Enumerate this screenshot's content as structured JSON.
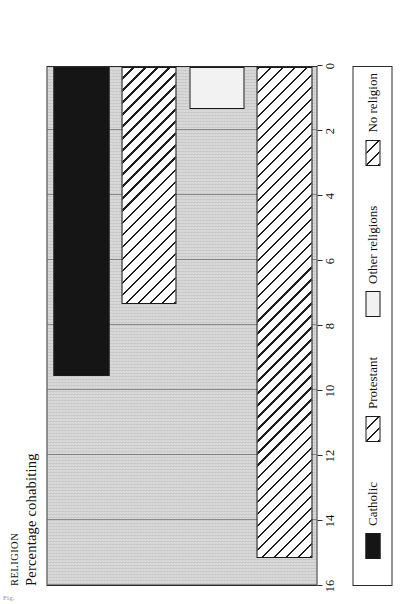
{
  "page": {
    "caption_fragment": "Fig."
  },
  "heading": {
    "kicker": "RELIGION",
    "subtitle": "Percentage  cohabiting"
  },
  "legend": {
    "items": [
      {
        "label": "Catholic",
        "swatch": "solid-black-swatch"
      },
      {
        "label": "Protestant",
        "swatch": "diagonal-hatch-swatch"
      },
      {
        "label": "Other  religions",
        "swatch": "light-fill-swatch"
      },
      {
        "label": "No  religion",
        "swatch": "diagonal-hatch-swatch"
      }
    ]
  },
  "chart_data": {
    "type": "bar",
    "title": "RELIGION",
    "subtitle": "Percentage  cohabiting",
    "orientation": "vertical-bars-printed-sideways",
    "xlabel": "",
    "ylabel": "Percentage cohabiting",
    "categories": [
      "Catholic",
      "Protestant",
      "Other religions",
      "No religion"
    ],
    "values": [
      9.5,
      7.3,
      1.3,
      15.1
    ],
    "ylim": [
      0,
      16
    ],
    "ticks": [
      16,
      14,
      12,
      10,
      8,
      6,
      4,
      2,
      0
    ],
    "tick_labels": [
      "16",
      "14",
      "12",
      "10",
      "8",
      "6",
      "4",
      "2",
      "0"
    ],
    "grid": true,
    "legend_position": "below-plot",
    "series": [
      {
        "name": "Percentage cohabiting",
        "points": [
          {
            "category": "Catholic",
            "value": 9.5,
            "fill": "solid-black"
          },
          {
            "category": "Protestant",
            "value": 7.3,
            "fill": "diagonal-hatch"
          },
          {
            "category": "Other religions",
            "value": 1.3,
            "fill": "light-fill"
          },
          {
            "category": "No religion",
            "value": 15.1,
            "fill": "diagonal-hatch"
          }
        ]
      }
    ]
  }
}
